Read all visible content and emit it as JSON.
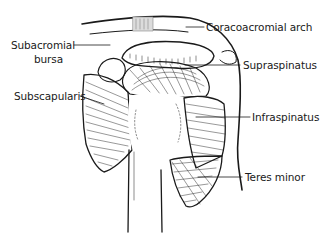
{
  "diagram": {
    "colors": {
      "ink": "#1a1a1a",
      "background": "#ffffff"
    },
    "labels": [
      {
        "id": "coracoacromial-arch",
        "text": "Coracoacromial arch",
        "side": "right"
      },
      {
        "id": "subacromial-bursa-1",
        "text": "Subacromial",
        "side": "left"
      },
      {
        "id": "subacromial-bursa-2",
        "text": "bursa",
        "side": "left"
      },
      {
        "id": "supraspinatus",
        "text": "Supraspinatus",
        "side": "right"
      },
      {
        "id": "subscapularis",
        "text": "Subscapularis",
        "side": "left"
      },
      {
        "id": "infraspinatus",
        "text": "Infraspinatus",
        "side": "right"
      },
      {
        "id": "teres-minor",
        "text": "Teres minor",
        "side": "right"
      }
    ]
  }
}
